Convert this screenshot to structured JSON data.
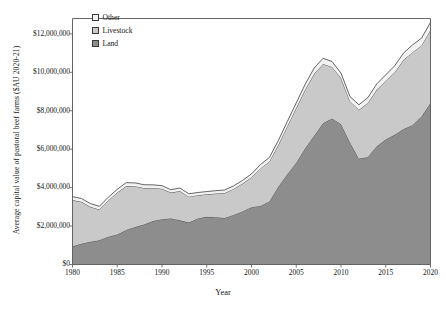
{
  "chart_data": {
    "type": "area",
    "stacked": true,
    "title": "",
    "xlabel": "Year",
    "ylabel": "Average capital value of pastoral beef farms ($AU 2020-21)",
    "xlim": [
      1980,
      2020
    ],
    "ylim": [
      0,
      12800000
    ],
    "grid": false,
    "legend_position": "top-left-inside",
    "x": [
      1980,
      1981,
      1982,
      1983,
      1984,
      1985,
      1986,
      1987,
      1988,
      1989,
      1990,
      1991,
      1992,
      1993,
      1994,
      1995,
      1996,
      1997,
      1998,
      1999,
      2000,
      2001,
      2002,
      2003,
      2004,
      2005,
      2006,
      2007,
      2008,
      2009,
      2010,
      2011,
      2012,
      2013,
      2014,
      2015,
      2016,
      2017,
      2018,
      2019,
      2020
    ],
    "xticks": [
      1980,
      1985,
      1990,
      1995,
      2000,
      2005,
      2010,
      2015,
      2020
    ],
    "xtick_labels": [
      "1980",
      "1985",
      "1990",
      "1995",
      "2000",
      "2005",
      "2010",
      "2015",
      "2020"
    ],
    "yticks": [
      0,
      2000000,
      4000000,
      6000000,
      8000000,
      10000000,
      12000000
    ],
    "ytick_labels": [
      "$0",
      "$2,000,000",
      "$4,000,000",
      "$6,000,000",
      "$8,000,000",
      "$10,000,000",
      "$12,000,000"
    ],
    "series": [
      {
        "name": "Land",
        "color": "#8d8d8d",
        "line_color": "#3f3f3f",
        "values": [
          950000,
          1080000,
          1180000,
          1260000,
          1450000,
          1560000,
          1800000,
          1950000,
          2080000,
          2260000,
          2360000,
          2400000,
          2300000,
          2180000,
          2400000,
          2480000,
          2460000,
          2420000,
          2580000,
          2760000,
          2980000,
          3050000,
          3280000,
          4050000,
          4700000,
          5300000,
          6050000,
          6700000,
          7350000,
          7600000,
          7300000,
          6350000,
          5500000,
          5600000,
          6150000,
          6500000,
          6750000,
          7050000,
          7250000,
          7700000,
          8400000
        ]
      },
      {
        "name": "Livestock",
        "color": "#c9c9c9",
        "line_color": "#3f3f3f",
        "values": [
          2400000,
          2180000,
          1820000,
          1600000,
          1880000,
          2180000,
          2280000,
          2120000,
          1900000,
          1720000,
          1580000,
          1340000,
          1520000,
          1350000,
          1200000,
          1170000,
          1230000,
          1300000,
          1350000,
          1450000,
          1560000,
          1950000,
          2080000,
          2180000,
          2500000,
          2850000,
          3050000,
          3220000,
          3080000,
          2680000,
          2400000,
          2150000,
          2550000,
          2800000,
          2950000,
          3050000,
          3250000,
          3600000,
          3800000,
          3700000,
          3800000
        ]
      },
      {
        "name": "Other",
        "color": "#f2f2f2",
        "line_color": "#3f3f3f",
        "values": [
          180000,
          175000,
          170000,
          165000,
          170000,
          175000,
          180000,
          175000,
          170000,
          165000,
          160000,
          150000,
          160000,
          150000,
          145000,
          145000,
          150000,
          155000,
          160000,
          165000,
          175000,
          200000,
          210000,
          220000,
          240000,
          260000,
          280000,
          300000,
          300000,
          280000,
          260000,
          240000,
          260000,
          280000,
          300000,
          320000,
          340000,
          360000,
          380000,
          380000,
          400000
        ]
      }
    ]
  },
  "legend": {
    "items": [
      {
        "label": "Other"
      },
      {
        "label": "Livestock"
      },
      {
        "label": "Land"
      }
    ]
  },
  "axes": {
    "x_title": "Year",
    "y_title": "Average capital value of pastoral beef farms ($AU 2020-21)"
  }
}
